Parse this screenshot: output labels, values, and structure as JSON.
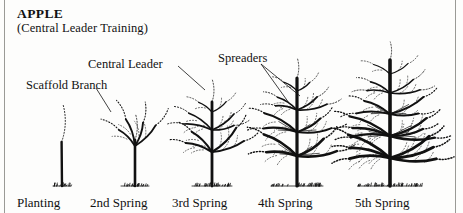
{
  "figure": {
    "title": "APPLE",
    "subtitle": "(Central Leader Training)",
    "ink_color": "#111111",
    "background_color": "#fdfdfc",
    "rule_color": "#9a9a96"
  },
  "callouts": [
    {
      "name": "central-leader",
      "label": "Central Leader"
    },
    {
      "name": "scaffold-branch",
      "label": "Scaffold Branch"
    },
    {
      "name": "spreaders",
      "label": "Spreaders"
    }
  ],
  "stages": [
    {
      "name": "planting",
      "label": "Planting",
      "label_x": 17,
      "trunk_x": 62,
      "ground_y": 186
    },
    {
      "name": "2nd-spring",
      "label": "2nd Spring",
      "label_x": 90,
      "trunk_x": 135,
      "ground_y": 186
    },
    {
      "name": "3rd-spring",
      "label": "3rd Spring",
      "label_x": 172,
      "trunk_x": 212,
      "ground_y": 186
    },
    {
      "name": "4th-spring",
      "label": "4th Spring",
      "label_x": 258,
      "trunk_x": 297,
      "ground_y": 186
    },
    {
      "name": "5th-spring",
      "label": "5th Spring",
      "label_x": 355,
      "trunk_x": 390,
      "ground_y": 186
    }
  ]
}
